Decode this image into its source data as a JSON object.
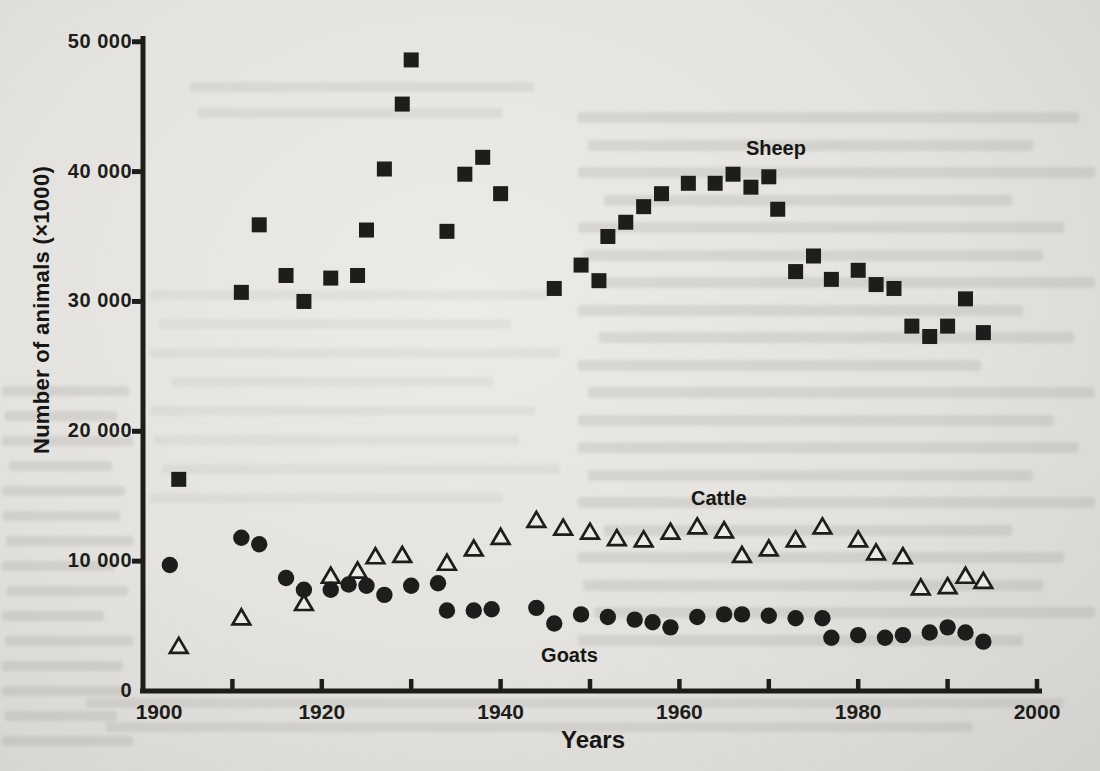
{
  "chart_data": {
    "type": "scatter",
    "title": "",
    "xlabel": "Years",
    "ylabel": "Number of animals (×1000)",
    "xlim": [
      1900,
      2000
    ],
    "ylim": [
      0,
      50000
    ],
    "grid": false,
    "legend_position": "inline-labels-near-series",
    "x_ticks": [
      1910,
      1920,
      1930,
      1940,
      1950,
      1960,
      1970,
      1980,
      1990,
      2000
    ],
    "x_tick_labels": [
      {
        "year": 1900,
        "label": "1900"
      },
      {
        "year": 1920,
        "label": "1920"
      },
      {
        "year": 1940,
        "label": "1940"
      },
      {
        "year": 1960,
        "label": "1960"
      },
      {
        "year": 1980,
        "label": "1980"
      },
      {
        "year": 2000,
        "label": "2000"
      }
    ],
    "y_tick_labels": [
      {
        "value": 0,
        "label": "0"
      },
      {
        "value": 10000,
        "label": "10 000"
      },
      {
        "value": 20000,
        "label": "20 000"
      },
      {
        "value": 30000,
        "label": "30 000"
      },
      {
        "value": 40000,
        "label": "40 000"
      },
      {
        "value": 50000,
        "label": "50 000"
      }
    ],
    "series": [
      {
        "name": "Sheep",
        "marker": "filled-square",
        "label_at": {
          "year": 1970.8,
          "value": 41800
        },
        "points": [
          [
            1904,
            16300
          ],
          [
            1911,
            30700
          ],
          [
            1913,
            35900
          ],
          [
            1916,
            32000
          ],
          [
            1918,
            30000
          ],
          [
            1921,
            31800
          ],
          [
            1924,
            32000
          ],
          [
            1925,
            35500
          ],
          [
            1927,
            40200
          ],
          [
            1929,
            45200
          ],
          [
            1930,
            48600
          ],
          [
            1934,
            35400
          ],
          [
            1936,
            39800
          ],
          [
            1938,
            41100
          ],
          [
            1940,
            38300
          ],
          [
            1946,
            31000
          ],
          [
            1949,
            32800
          ],
          [
            1951,
            31600
          ],
          [
            1952,
            35000
          ],
          [
            1954,
            36100
          ],
          [
            1956,
            37300
          ],
          [
            1958,
            38300
          ],
          [
            1961,
            39100
          ],
          [
            1964,
            39100
          ],
          [
            1966,
            39800
          ],
          [
            1968,
            38800
          ],
          [
            1970,
            39600
          ],
          [
            1971,
            37100
          ],
          [
            1973,
            32300
          ],
          [
            1975,
            33500
          ],
          [
            1977,
            31700
          ],
          [
            1980,
            32400
          ],
          [
            1982,
            31300
          ],
          [
            1984,
            31000
          ],
          [
            1986,
            28100
          ],
          [
            1988,
            27300
          ],
          [
            1990,
            28100
          ],
          [
            1992,
            30200
          ],
          [
            1994,
            27600
          ]
        ]
      },
      {
        "name": "Cattle",
        "marker": "open-triangle",
        "label_at": {
          "year": 1964.4,
          "value": 14900
        },
        "points": [
          [
            1904,
            3400
          ],
          [
            1911,
            5600
          ],
          [
            1918,
            6700
          ],
          [
            1921,
            8800
          ],
          [
            1924,
            9200
          ],
          [
            1926,
            10300
          ],
          [
            1929,
            10400
          ],
          [
            1934,
            9800
          ],
          [
            1937,
            10900
          ],
          [
            1940,
            11800
          ],
          [
            1944,
            13100
          ],
          [
            1947,
            12500
          ],
          [
            1950,
            12200
          ],
          [
            1953,
            11700
          ],
          [
            1956,
            11600
          ],
          [
            1959,
            12200
          ],
          [
            1962,
            12600
          ],
          [
            1965,
            12300
          ],
          [
            1967,
            10400
          ],
          [
            1970,
            10900
          ],
          [
            1973,
            11600
          ],
          [
            1976,
            12600
          ],
          [
            1980,
            11600
          ],
          [
            1982,
            10600
          ],
          [
            1985,
            10300
          ],
          [
            1987,
            7900
          ],
          [
            1990,
            8000
          ],
          [
            1992,
            8800
          ],
          [
            1994,
            8400
          ]
        ]
      },
      {
        "name": "Goats",
        "marker": "filled-circle",
        "label_at": {
          "year": 1947.7,
          "value": 2800
        },
        "points": [
          [
            1903,
            9700
          ],
          [
            1911,
            11800
          ],
          [
            1913,
            11300
          ],
          [
            1916,
            8700
          ],
          [
            1918,
            7800
          ],
          [
            1921,
            7800
          ],
          [
            1923,
            8200
          ],
          [
            1925,
            8100
          ],
          [
            1927,
            7400
          ],
          [
            1930,
            8100
          ],
          [
            1933,
            8300
          ],
          [
            1934,
            6200
          ],
          [
            1937,
            6200
          ],
          [
            1939,
            6300
          ],
          [
            1944,
            6400
          ],
          [
            1946,
            5200
          ],
          [
            1949,
            5900
          ],
          [
            1952,
            5700
          ],
          [
            1955,
            5500
          ],
          [
            1957,
            5300
          ],
          [
            1959,
            4900
          ],
          [
            1962,
            5700
          ],
          [
            1965,
            5900
          ],
          [
            1967,
            5900
          ],
          [
            1970,
            5800
          ],
          [
            1973,
            5600
          ],
          [
            1976,
            5600
          ],
          [
            1977,
            4100
          ],
          [
            1980,
            4300
          ],
          [
            1983,
            4100
          ],
          [
            1985,
            4300
          ],
          [
            1988,
            4500
          ],
          [
            1990,
            4900
          ],
          [
            1992,
            4500
          ],
          [
            1994,
            3800
          ]
        ]
      }
    ]
  },
  "colors": {
    "ink": "#1d1d1b",
    "paper": "#e6e4e0",
    "ghost_text": "#6f6d67"
  }
}
